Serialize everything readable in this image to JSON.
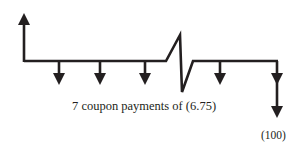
{
  "diagram": {
    "type": "cash-flow timeline",
    "colors": {
      "line": "#231f20",
      "text": "#231f20",
      "background": "#ffffff"
    },
    "inflow": {
      "direction": "up",
      "position": 0
    },
    "coupon_arrows": {
      "count_shown": 5,
      "direction": "down"
    },
    "break_marker": "zig-zag",
    "principal_arrow": {
      "direction": "down"
    },
    "labels": {
      "coupon": "7 coupon payments of (6.75)",
      "principal": "(100)"
    }
  }
}
